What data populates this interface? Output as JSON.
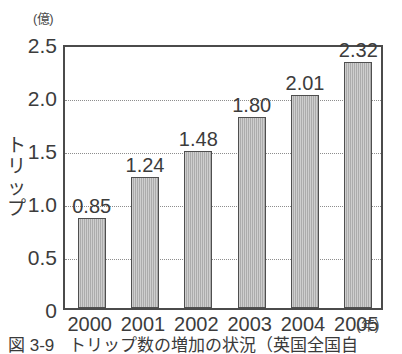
{
  "chart_data": {
    "type": "bar",
    "title": "",
    "unit_label": "(億)",
    "xlabel": "",
    "xlabel_unit": "(年)",
    "ylabel": "トリップ",
    "categories": [
      "2000",
      "2001",
      "2002",
      "2003",
      "2004",
      "2005"
    ],
    "values": [
      0.85,
      1.24,
      1.48,
      1.8,
      2.01,
      2.32
    ],
    "value_labels": [
      "0.85",
      "1.24",
      "1.48",
      "1.80",
      "2.01",
      "2.32"
    ],
    "ylim": [
      0,
      2.5
    ],
    "yticks": [
      0,
      0.5,
      1.0,
      1.5,
      2.0,
      2.5
    ],
    "ytick_labels": [
      "0",
      "0.5",
      "1.0",
      "1.5",
      "2.0",
      "2.5"
    ],
    "grid": true,
    "grid_style": "dotted-horizontal",
    "legend": "none",
    "bar_color": "#b4b4b4",
    "bar_border_color": "#4f4f4f",
    "axis_color": "#4b4b4b",
    "text_color": "#3c3c3c"
  },
  "axis_title": {
    "vertical_chars": [
      "ト",
      "リ",
      "ッ",
      "プ"
    ]
  },
  "caption": {
    "number": "図 3-9",
    "text": "トリップ数の増加の状況（英国全国自"
  }
}
